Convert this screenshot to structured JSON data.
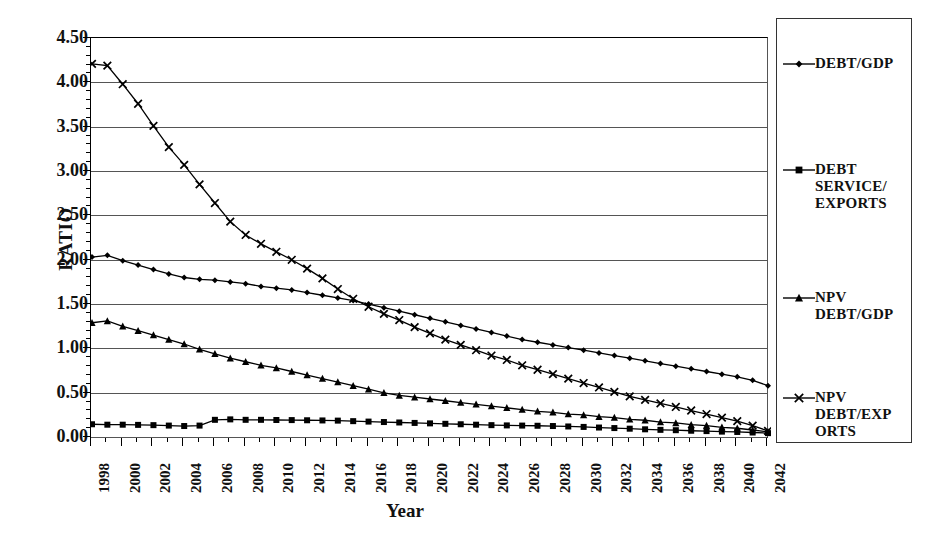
{
  "chart_data": {
    "type": "line",
    "title": "",
    "xlabel": "Year",
    "ylabel": "RATIO",
    "ylim": [
      0.0,
      4.5
    ],
    "ytick_step": 0.5,
    "ytick_labels": [
      "4.50",
      "4.00",
      "3.50",
      "3.00",
      "2.50",
      "2.00",
      "1.50",
      "1.00",
      "0.50",
      "0.00"
    ],
    "grid": true,
    "legend_position": "right",
    "xlim": [
      1998,
      2042
    ],
    "x": [
      1998,
      1999,
      2000,
      2001,
      2002,
      2003,
      2004,
      2005,
      2006,
      2007,
      2008,
      2009,
      2010,
      2011,
      2012,
      2013,
      2014,
      2015,
      2016,
      2017,
      2018,
      2019,
      2020,
      2021,
      2022,
      2023,
      2024,
      2025,
      2026,
      2027,
      2028,
      2029,
      2030,
      2031,
      2032,
      2033,
      2034,
      2035,
      2036,
      2037,
      2038,
      2039,
      2040,
      2041,
      2042
    ],
    "xtick_labels": [
      "1998",
      "2000",
      "2002",
      "2004",
      "2006",
      "2008",
      "2010",
      "2012",
      "2014",
      "2016",
      "2018",
      "2020",
      "2022",
      "2024",
      "2026",
      "2028",
      "2030",
      "2032",
      "2034",
      "2036",
      "2038",
      "2040",
      "2042"
    ],
    "series": [
      {
        "name": "DEBT/GDP",
        "marker": "diamond",
        "color": "#000000",
        "values": [
          2.04,
          2.06,
          2.0,
          1.95,
          1.9,
          1.85,
          1.81,
          1.79,
          1.78,
          1.76,
          1.74,
          1.71,
          1.69,
          1.67,
          1.64,
          1.61,
          1.58,
          1.55,
          1.51,
          1.47,
          1.43,
          1.39,
          1.35,
          1.31,
          1.27,
          1.23,
          1.19,
          1.15,
          1.11,
          1.08,
          1.05,
          1.02,
          0.99,
          0.96,
          0.93,
          0.9,
          0.87,
          0.84,
          0.81,
          0.78,
          0.75,
          0.72,
          0.69,
          0.65,
          0.59
        ]
      },
      {
        "name": "DEBT SERVICE/\nEXPORTS",
        "marker": "square",
        "color": "#000000",
        "values": [
          0.155,
          0.15,
          0.15,
          0.148,
          0.145,
          0.14,
          0.135,
          0.14,
          0.205,
          0.21,
          0.205,
          0.205,
          0.203,
          0.202,
          0.2,
          0.198,
          0.196,
          0.19,
          0.185,
          0.18,
          0.175,
          0.17,
          0.165,
          0.16,
          0.155,
          0.15,
          0.145,
          0.142,
          0.14,
          0.138,
          0.135,
          0.13,
          0.125,
          0.118,
          0.112,
          0.105,
          0.098,
          0.092,
          0.088,
          0.082,
          0.078,
          0.072,
          0.068,
          0.062,
          0.055
        ]
      },
      {
        "name": "NPV\nDEBT/GDP",
        "marker": "triangle",
        "color": "#000000",
        "values": [
          1.3,
          1.32,
          1.26,
          1.21,
          1.16,
          1.11,
          1.06,
          1.0,
          0.95,
          0.9,
          0.86,
          0.82,
          0.79,
          0.75,
          0.71,
          0.67,
          0.63,
          0.59,
          0.55,
          0.51,
          0.48,
          0.46,
          0.44,
          0.42,
          0.4,
          0.38,
          0.36,
          0.34,
          0.32,
          0.3,
          0.29,
          0.27,
          0.26,
          0.24,
          0.23,
          0.21,
          0.2,
          0.18,
          0.17,
          0.15,
          0.14,
          0.12,
          0.11,
          0.09,
          0.07
        ]
      },
      {
        "name": "NPV\nDEBT/EXP\nORTS",
        "marker": "cross",
        "color": "#000000",
        "values": [
          4.22,
          4.2,
          3.99,
          3.77,
          3.52,
          3.28,
          3.08,
          2.86,
          2.65,
          2.44,
          2.29,
          2.19,
          2.1,
          2.01,
          1.91,
          1.8,
          1.68,
          1.57,
          1.48,
          1.4,
          1.33,
          1.25,
          1.18,
          1.11,
          1.05,
          0.99,
          0.93,
          0.88,
          0.82,
          0.77,
          0.72,
          0.67,
          0.62,
          0.57,
          0.52,
          0.47,
          0.43,
          0.39,
          0.35,
          0.31,
          0.27,
          0.23,
          0.19,
          0.14,
          0.08
        ]
      }
    ]
  },
  "legend": {
    "items": [
      {
        "label": "DEBT/GDP",
        "marker": "diamond"
      },
      {
        "label": "DEBT\nSERVICE/\nEXPORTS",
        "marker": "square"
      },
      {
        "label": "NPV\nDEBT/GDP",
        "marker": "triangle"
      },
      {
        "label": "NPV\nDEBT/EXP\nORTS",
        "marker": "cross"
      }
    ]
  }
}
